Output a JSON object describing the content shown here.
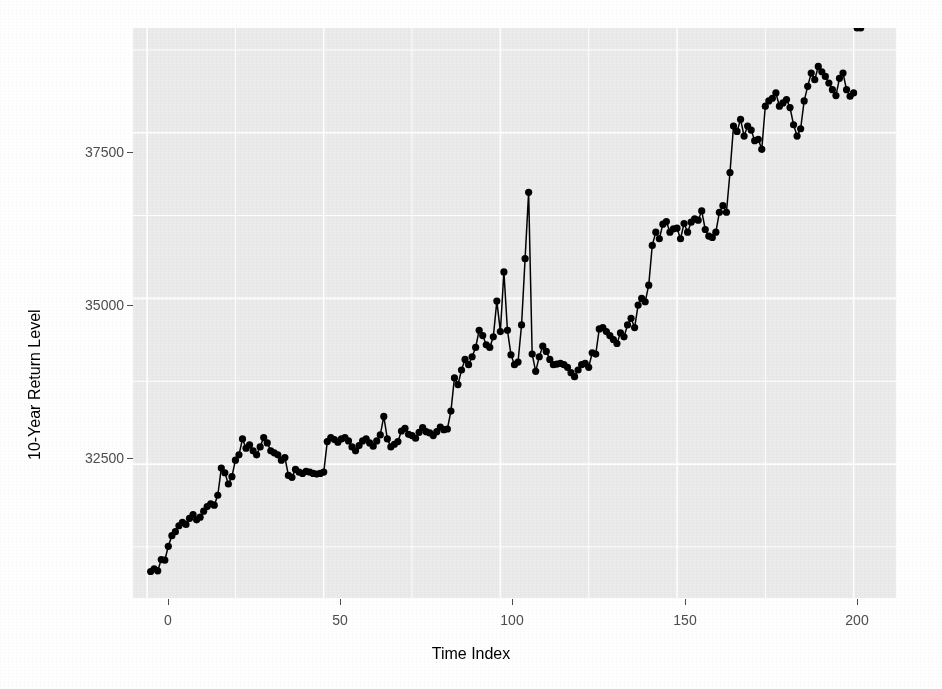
{
  "figure": {
    "background_color": "#ffffff",
    "panel_color": "#ebebeb",
    "grid_color": "#ffffff",
    "series_color": "#000000",
    "tick_color": "#4d4d4d"
  },
  "ghost_text": {
    "lines": "reversed show-through text from page verso"
  },
  "chart_data": {
    "type": "line",
    "title": "",
    "subtitle": "",
    "xlabel": "Time Index",
    "ylabel": "10-Year Return Level",
    "grid": true,
    "legend": null,
    "marker": "filled-circle",
    "xlim": [
      -4,
      212
    ],
    "ylim": [
      30480,
      39080
    ],
    "xticks": [
      0,
      50,
      100,
      150,
      200
    ],
    "xtick_labels": [
      "0",
      "50",
      "100",
      "150",
      "200"
    ],
    "yticks": [
      32500,
      35000,
      37500
    ],
    "ytick_labels": [
      "32500",
      "35000",
      "37500"
    ],
    "x": [
      1,
      2,
      3,
      4,
      5,
      6,
      7,
      8,
      9,
      10,
      11,
      12,
      13,
      14,
      15,
      16,
      17,
      18,
      19,
      20,
      21,
      22,
      23,
      24,
      25,
      26,
      27,
      28,
      29,
      30,
      31,
      32,
      33,
      34,
      35,
      36,
      37,
      38,
      39,
      40,
      41,
      42,
      43,
      44,
      45,
      46,
      47,
      48,
      49,
      50,
      51,
      52,
      53,
      54,
      55,
      56,
      57,
      58,
      59,
      60,
      61,
      62,
      63,
      64,
      65,
      66,
      67,
      68,
      69,
      70,
      71,
      72,
      73,
      74,
      75,
      76,
      77,
      78,
      79,
      80,
      81,
      82,
      83,
      84,
      85,
      86,
      87,
      88,
      89,
      90,
      91,
      92,
      93,
      94,
      95,
      96,
      97,
      98,
      99,
      100,
      101,
      102,
      103,
      104,
      105,
      106,
      107,
      108,
      109,
      110,
      111,
      112,
      113,
      114,
      115,
      116,
      117,
      118,
      119,
      120,
      121,
      122,
      123,
      124,
      125,
      126,
      127,
      128,
      129,
      130,
      131,
      132,
      133,
      134,
      135,
      136,
      137,
      138,
      139,
      140,
      141,
      142,
      143,
      144,
      145,
      146,
      147,
      148,
      149,
      150,
      151,
      152,
      153,
      154,
      155,
      156,
      157,
      158,
      159,
      160,
      161,
      162,
      163,
      164,
      165,
      166,
      167,
      168,
      169,
      170,
      171,
      172,
      173,
      174,
      175,
      176,
      177,
      178,
      179,
      180,
      181,
      182,
      183,
      184,
      185,
      186,
      187,
      188,
      189,
      190,
      191,
      192,
      193,
      194,
      195,
      196,
      197,
      198,
      199,
      200,
      201,
      202
    ],
    "y": [
      30880,
      30920,
      30890,
      31060,
      31050,
      31260,
      31420,
      31480,
      31570,
      31620,
      31590,
      31680,
      31740,
      31660,
      31700,
      31790,
      31860,
      31900,
      31880,
      32030,
      32440,
      32370,
      32200,
      32310,
      32560,
      32640,
      32880,
      32740,
      32790,
      32700,
      32640,
      32760,
      32900,
      32820,
      32700,
      32670,
      32640,
      32560,
      32600,
      32330,
      32300,
      32420,
      32380,
      32360,
      32390,
      32380,
      32360,
      32350,
      32360,
      32380,
      32840,
      32900,
      32870,
      32830,
      32880,
      32900,
      32850,
      32760,
      32700,
      32780,
      32850,
      32880,
      32820,
      32770,
      32850,
      32940,
      33220,
      32880,
      32760,
      32800,
      32840,
      33000,
      33040,
      32950,
      32930,
      32890,
      32980,
      33050,
      32990,
      32970,
      32930,
      32990,
      33060,
      33020,
      33030,
      33300,
      33800,
      33700,
      33920,
      34080,
      34000,
      34120,
      34260,
      34520,
      34440,
      34300,
      34260,
      34420,
      34960,
      34500,
      35400,
      34520,
      34150,
      34000,
      34040,
      34600,
      35600,
      36600,
      34160,
      33900,
      34120,
      34280,
      34200,
      34080,
      34000,
      34010,
      34020,
      34000,
      33960,
      33880,
      33820,
      33920,
      34000,
      34020,
      33960,
      34180,
      34160,
      34540,
      34560,
      34500,
      34440,
      34380,
      34320,
      34480,
      34420,
      34600,
      34700,
      34560,
      34900,
      35000,
      34950,
      35200,
      35800,
      36000,
      35900,
      36120,
      36160,
      36000,
      36050,
      36060,
      35900,
      36130,
      36000,
      36150,
      36200,
      36180,
      36320,
      36040,
      35940,
      35920,
      36000,
      36300,
      36400,
      36300,
      36900,
      37600,
      37520,
      37700,
      37450,
      37600,
      37540,
      37380,
      37400,
      37250,
      37900,
      37980,
      38020,
      38100,
      37900,
      37950,
      38000,
      37880,
      37620,
      37450,
      37560,
      37980,
      38200,
      38400,
      38300,
      38500,
      38420,
      38350,
      38250,
      38150,
      38060,
      38320,
      38400,
      38150,
      38050,
      38100
    ]
  }
}
